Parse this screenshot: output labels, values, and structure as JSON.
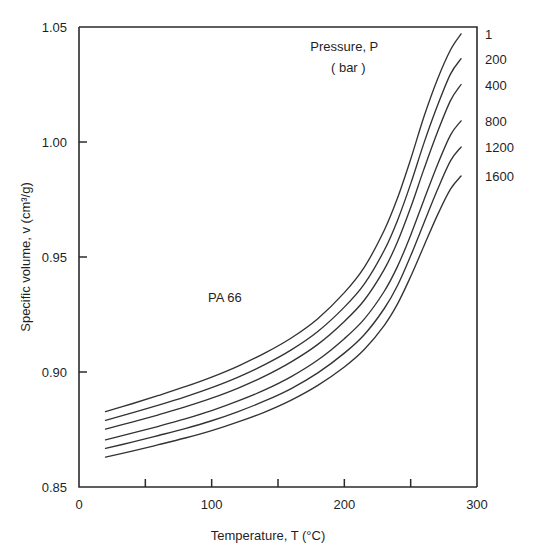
{
  "chart_data": {
    "type": "line",
    "title": "",
    "xlabel": "Temperature, T  (°C)",
    "ylabel": "Specific volume, v (cm³/g)",
    "xlim": [
      0,
      300
    ],
    "ylim": [
      0.85,
      1.05
    ],
    "grid": false,
    "legend_position": "right-edge",
    "x_ticks": [
      0,
      50,
      100,
      150,
      200,
      250,
      300
    ],
    "x_tick_labels": [
      "0",
      "",
      "100",
      "",
      "200",
      "",
      "300"
    ],
    "y_ticks": [
      0.85,
      0.9,
      0.95,
      1.0,
      1.05
    ],
    "y_tick_labels": [
      "0.85",
      "0.90",
      "0.95",
      "1.00",
      "1.05"
    ],
    "annotations": [
      {
        "id": "pressure-header-line1",
        "text": "Pressure, P",
        "x": 200,
        "y": 1.0395
      },
      {
        "id": "pressure-header-line2",
        "text": "( bar )",
        "x": 203,
        "y": 1.0305
      },
      {
        "id": "material-label",
        "text": "PA 66",
        "x": 110,
        "y": 0.9305
      }
    ],
    "legend_unit": "bar",
    "legend_title": "Pressure, P",
    "series": [
      {
        "name": "1",
        "label": "1",
        "pressure_bar": 1,
        "x": [
          20,
          40,
          60,
          80,
          100,
          120,
          140,
          160,
          180,
          200,
          215,
          230,
          240,
          250,
          260,
          270,
          280,
          288
        ],
        "values": [
          0.8828,
          0.8862,
          0.8898,
          0.8936,
          0.8978,
          0.9026,
          0.9082,
          0.9148,
          0.9232,
          0.9345,
          0.9455,
          0.9615,
          0.9755,
          0.9925,
          1.011,
          1.027,
          1.04,
          1.047
        ]
      },
      {
        "name": "200",
        "label": "200",
        "pressure_bar": 200,
        "x": [
          20,
          40,
          60,
          80,
          100,
          120,
          140,
          160,
          180,
          200,
          215,
          230,
          240,
          250,
          260,
          270,
          280,
          288
        ],
        "values": [
          0.879,
          0.8822,
          0.8856,
          0.8892,
          0.8932,
          0.8978,
          0.9032,
          0.9096,
          0.9176,
          0.9282,
          0.9382,
          0.9528,
          0.9658,
          0.9818,
          0.9995,
          1.0155,
          1.0295,
          1.0362
        ]
      },
      {
        "name": "400",
        "label": "400",
        "pressure_bar": 400,
        "x": [
          20,
          40,
          60,
          80,
          100,
          120,
          140,
          160,
          180,
          200,
          215,
          230,
          240,
          250,
          260,
          270,
          280,
          288
        ],
        "values": [
          0.8752,
          0.8782,
          0.8814,
          0.8848,
          0.8886,
          0.893,
          0.8982,
          0.9044,
          0.912,
          0.922,
          0.9312,
          0.9445,
          0.9565,
          0.9715,
          0.9882,
          1.004,
          1.018,
          1.025
        ]
      },
      {
        "name": "800",
        "label": "800",
        "pressure_bar": 800,
        "x": [
          20,
          40,
          60,
          80,
          100,
          120,
          140,
          160,
          180,
          200,
          215,
          230,
          240,
          250,
          260,
          270,
          280,
          288
        ],
        "values": [
          0.8705,
          0.8734,
          0.8764,
          0.8796,
          0.8832,
          0.8874,
          0.8922,
          0.898,
          0.9052,
          0.9145,
          0.923,
          0.935,
          0.9458,
          0.9595,
          0.9748,
          0.9898,
          1.003,
          1.0092
        ]
      },
      {
        "name": "1200",
        "label": "1200",
        "pressure_bar": 1200,
        "x": [
          20,
          40,
          60,
          80,
          100,
          120,
          140,
          160,
          180,
          200,
          215,
          230,
          240,
          250,
          260,
          270,
          280,
          288
        ],
        "values": [
          0.8668,
          0.8695,
          0.8724,
          0.8754,
          0.8788,
          0.8828,
          0.8874,
          0.8928,
          0.8996,
          0.9082,
          0.9162,
          0.9275,
          0.9375,
          0.9505,
          0.9648,
          0.979,
          0.9918,
          0.9978
        ]
      },
      {
        "name": "1600",
        "label": "1600",
        "pressure_bar": 1600,
        "x": [
          20,
          40,
          60,
          80,
          100,
          120,
          140,
          160,
          180,
          200,
          215,
          230,
          240,
          250,
          260,
          270,
          280,
          288
        ],
        "values": [
          0.863,
          0.8656,
          0.8684,
          0.8713,
          0.8745,
          0.8783,
          0.8826,
          0.8878,
          0.8942,
          0.9022,
          0.9098,
          0.9202,
          0.9295,
          0.9415,
          0.9548,
          0.968,
          0.9795,
          0.9852
        ]
      }
    ]
  },
  "style": {
    "line_color": "#333333",
    "axis_color": "#2b2b2b",
    "text_color": "#1f1f1f",
    "background": "#ffffff"
  }
}
